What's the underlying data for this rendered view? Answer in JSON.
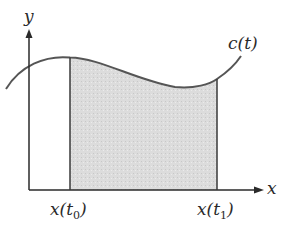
{
  "diagram": {
    "type": "area-under-parametric-curve",
    "axes": {
      "x_label": "x",
      "y_label": "y"
    },
    "curve": {
      "label": "c(t)"
    },
    "bounds": {
      "left": {
        "label_main": "x(t",
        "label_sub": "0",
        "label_close": ")"
      },
      "right": {
        "label_main": "x(t",
        "label_sub": "1",
        "label_close": ")"
      }
    },
    "colors": {
      "stroke": "#3a3a3a",
      "curve": "#555555",
      "shaded_fill": "#d9d9d9",
      "background": "#ffffff"
    }
  }
}
